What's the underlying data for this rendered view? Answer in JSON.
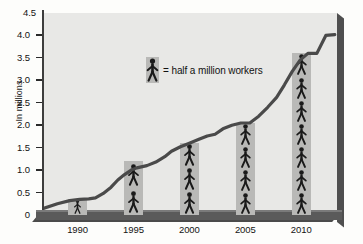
{
  "chart_data": {
    "type": "bar",
    "title": "",
    "subtitle": "",
    "xlabel": "",
    "ylabel": "In millions",
    "categories": [
      "1990",
      "1995",
      "2000",
      "2005",
      "2010"
    ],
    "values": [
      0.35,
      1.2,
      1.6,
      2.05,
      3.6
    ],
    "pictogram_counts": [
      1,
      2,
      3,
      4,
      7
    ],
    "pictogram_unit": 0.5,
    "ylim": [
      0,
      4.5
    ],
    "ytick_labels": [
      "0",
      "0.5",
      "1.0",
      "1.5",
      "2.0",
      "2.5",
      "3.0",
      "3.5",
      "4.0",
      "4.5"
    ],
    "ytick_values": [
      0,
      0.5,
      1.0,
      1.5,
      2.0,
      2.5,
      3.0,
      3.5,
      4.0,
      4.5
    ],
    "xtick_labels": [
      "1990",
      "1995",
      "2000",
      "2005",
      "2010"
    ],
    "grid": false,
    "legend": {
      "position": "inside-top-center",
      "icon": "worker-pictogram-icon",
      "text": "= half a million workers",
      "unit_value": 0.5
    },
    "series": [
      {
        "name": "trend",
        "type": "line",
        "x": [
          1987.0,
          1988.2,
          1989.3,
          1990.2,
          1991.0,
          1991.6,
          1992.3,
          1993.0,
          1993.6,
          1994.2,
          1994.8,
          1995.3,
          1996.2,
          1997.0,
          1997.8,
          1998.4,
          1999.2,
          2000.0,
          2000.8,
          2001.6,
          2002.3,
          2003.0,
          2003.8,
          2004.6,
          2005.4,
          2006.2,
          2007.0,
          2007.8,
          2008.5,
          2009.2,
          2009.9,
          2010.6,
          2011.4,
          2012.2,
          2013.0
        ],
        "y": [
          0.15,
          0.25,
          0.32,
          0.35,
          0.36,
          0.38,
          0.48,
          0.62,
          0.78,
          0.9,
          1.0,
          1.05,
          1.1,
          1.18,
          1.3,
          1.42,
          1.52,
          1.6,
          1.68,
          1.76,
          1.8,
          1.92,
          2.0,
          2.05,
          2.05,
          2.2,
          2.4,
          2.62,
          2.9,
          3.2,
          3.45,
          3.6,
          3.6,
          4.0,
          4.02
        ]
      }
    ],
    "colors": {
      "plot_background": "#e8e8e6",
      "page_background": "#fdfdfb",
      "bar_fill": "#b9b9b7",
      "line": "#4a4a4a",
      "axis": "#3d3d3d",
      "frame_shadow": "#4f4f4f",
      "text": "#131313",
      "pictogram": "#1a1a1a"
    }
  }
}
